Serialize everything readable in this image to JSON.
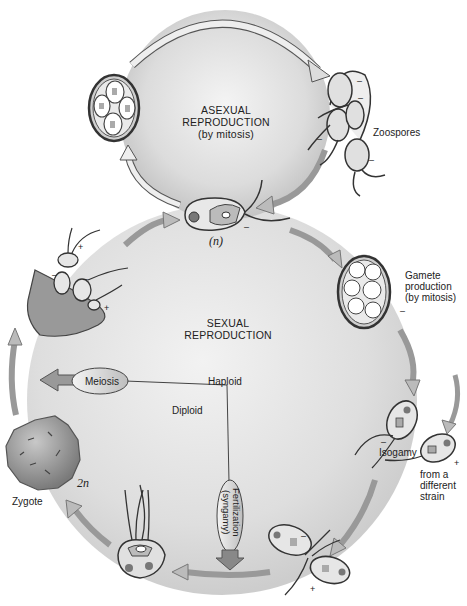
{
  "diagram": {
    "cycles": {
      "asexual": {
        "label_line1": "ASEXUAL",
        "label_line2": "REPRODUCTION",
        "label_line3": "(by mitosis)"
      },
      "sexual": {
        "label_line1": "SEXUAL",
        "label_line2": "REPRODUCTION"
      }
    },
    "stages": {
      "zoospores": "Zoospores",
      "haploid_cell_ploidy": "(n)",
      "gamete_production_line1": "Gamete",
      "gamete_production_line2": "production",
      "gamete_production_line3": "(by mitosis)",
      "isogamy": "Isogamy",
      "from_strain_line1": "from a",
      "from_strain_line2": "different",
      "from_strain_line3": "strain",
      "zygote": "Zygote",
      "zygote_ploidy": "2n"
    },
    "processes": {
      "meiosis": "Meiosis",
      "fertilization_line1": "Fertilization",
      "fertilization_line2": "(syngamy)"
    },
    "regions": {
      "haploid": "Haploid",
      "diploid": "Diploid"
    },
    "mating_signs": {
      "minus": "–",
      "plus": "+"
    },
    "colors": {
      "background": "#ffffff",
      "circle_fill_center": "#f2f2f2",
      "circle_fill_edge": "#c8c8c8",
      "arrow_fill": "#b5b5b5",
      "cell_outline": "#3a3a3a",
      "cell_fill": "#d9d9d9",
      "zygote_fill": "#9a9a9a"
    }
  }
}
